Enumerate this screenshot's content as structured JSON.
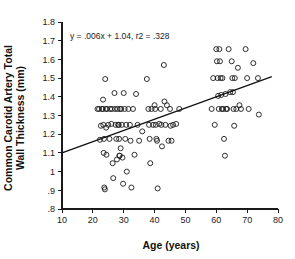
{
  "chart_data": {
    "type": "scatter",
    "title": "",
    "xlabel": "Age (years)",
    "ylabel": "Common Carotid Artery Total Wall Thickness (mm)",
    "ylabel_line1": "Common Carotid Artery Total",
    "ylabel_line2": "Wall Thickness (mm)",
    "xlim": [
      10,
      80
    ],
    "ylim": [
      0.8,
      1.8
    ],
    "xticks": [
      10,
      20,
      30,
      40,
      50,
      60,
      70,
      80
    ],
    "xtick_labels": [
      "10",
      "20",
      "30",
      "40",
      "50",
      "60",
      "70",
      "80"
    ],
    "yticks": [
      0.8,
      0.9,
      1.0,
      1.1,
      1.2,
      1.3,
      1.4,
      1.5,
      1.6,
      1.7,
      1.8
    ],
    "ytick_labels": [
      ".8",
      ".9",
      "1",
      "1.1",
      "1.2",
      "1.3",
      "1.4",
      "1.5",
      "1.6",
      "1.7",
      "1.8"
    ],
    "grid": false,
    "legend": null,
    "marker_style": "open-circle",
    "marker_color": "#1a1a1a",
    "annotation": "y = .006x + 1.04, r2 = .328",
    "fit": {
      "type": "linear",
      "slope": 0.006,
      "intercept": 1.04,
      "r_squared": 0.328,
      "x_start": 10,
      "x_end": 78,
      "y_start": 1.1,
      "y_end": 1.508
    },
    "points": [
      [
        21.5,
        1.335
      ],
      [
        22.0,
        1.335
      ],
      [
        22.3,
        1.17
      ],
      [
        22.6,
        1.245
      ],
      [
        23.0,
        1.335
      ],
      [
        23.2,
        1.335
      ],
      [
        23.3,
        1.385
      ],
      [
        23.4,
        1.25
      ],
      [
        23.5,
        1.1
      ],
      [
        23.6,
        1.175
      ],
      [
        23.7,
        0.915
      ],
      [
        23.9,
        0.905
      ],
      [
        24.0,
        1.495
      ],
      [
        24.2,
        1.335
      ],
      [
        24.3,
        1.235
      ],
      [
        24.4,
        1.09
      ],
      [
        24.6,
        1.335
      ],
      [
        25.0,
        1.25
      ],
      [
        25.4,
        1.175
      ],
      [
        25.6,
        1.335
      ],
      [
        26.0,
        1.255
      ],
      [
        26.2,
        1.335
      ],
      [
        26.4,
        1.045
      ],
      [
        26.6,
        0.965
      ],
      [
        27.0,
        1.42
      ],
      [
        27.2,
        1.335
      ],
      [
        27.4,
        1.25
      ],
      [
        27.6,
        1.175
      ],
      [
        27.8,
        1.065
      ],
      [
        28.0,
        1.335
      ],
      [
        28.2,
        1.25
      ],
      [
        28.4,
        1.25
      ],
      [
        28.5,
        1.175
      ],
      [
        28.6,
        1.085
      ],
      [
        28.7,
        1.085
      ],
      [
        28.8,
        1.335
      ],
      [
        29.0,
        1.125
      ],
      [
        29.2,
        1.335
      ],
      [
        29.4,
        1.25
      ],
      [
        29.6,
        1.075
      ],
      [
        29.8,
        0.935
      ],
      [
        30.0,
        1.42
      ],
      [
        30.3,
        1.335
      ],
      [
        30.5,
        1.175
      ],
      [
        30.8,
        1.25
      ],
      [
        31.0,
        1.0
      ],
      [
        31.5,
        1.335
      ],
      [
        32.0,
        1.25
      ],
      [
        32.2,
        1.165
      ],
      [
        32.5,
        0.915
      ],
      [
        33.0,
        1.335
      ],
      [
        33.5,
        1.09
      ],
      [
        34.0,
        1.415
      ],
      [
        34.5,
        1.25
      ],
      [
        35.0,
        1.165
      ],
      [
        36.0,
        1.215
      ],
      [
        37.5,
        1.495
      ],
      [
        38.0,
        1.335
      ],
      [
        38.2,
        1.25
      ],
      [
        38.4,
        1.175
      ],
      [
        38.6,
        1.045
      ],
      [
        39.0,
        1.335
      ],
      [
        39.5,
        1.25
      ],
      [
        40.0,
        1.355
      ],
      [
        40.2,
        1.335
      ],
      [
        40.4,
        1.25
      ],
      [
        40.6,
        1.175
      ],
      [
        40.8,
        1.165
      ],
      [
        41.0,
        0.91
      ],
      [
        41.5,
        1.255
      ],
      [
        42.0,
        1.335
      ],
      [
        42.2,
        1.25
      ],
      [
        42.4,
        1.135
      ],
      [
        43.0,
        1.57
      ],
      [
        43.2,
        1.375
      ],
      [
        43.5,
        1.25
      ],
      [
        44.0,
        1.355
      ],
      [
        44.5,
        1.165
      ],
      [
        45.0,
        1.335
      ],
      [
        45.2,
        1.245
      ],
      [
        45.5,
        1.165
      ],
      [
        46.0,
        1.25
      ],
      [
        47.0,
        1.255
      ],
      [
        48.0,
        1.335
      ],
      [
        58.5,
        1.335
      ],
      [
        59.0,
        1.5
      ],
      [
        59.5,
        1.25
      ],
      [
        60.0,
        1.655
      ],
      [
        60.2,
        1.59
      ],
      [
        60.4,
        1.5
      ],
      [
        60.6,
        1.405
      ],
      [
        60.8,
        1.335
      ],
      [
        61.0,
        1.655
      ],
      [
        61.2,
        1.59
      ],
      [
        61.4,
        1.5
      ],
      [
        61.6,
        1.41
      ],
      [
        61.8,
        1.335
      ],
      [
        62.0,
        1.5
      ],
      [
        62.2,
        1.335
      ],
      [
        62.5,
        1.175
      ],
      [
        62.8,
        1.085
      ],
      [
        63.0,
        1.415
      ],
      [
        63.2,
        1.335
      ],
      [
        63.5,
        1.335
      ],
      [
        64.0,
        1.655
      ],
      [
        64.5,
        1.425
      ],
      [
        65.0,
        1.59
      ],
      [
        65.2,
        1.5
      ],
      [
        65.4,
        1.425
      ],
      [
        65.6,
        1.335
      ],
      [
        65.8,
        1.245
      ],
      [
        66.0,
        1.5
      ],
      [
        66.5,
        1.335
      ],
      [
        67.0,
        1.555
      ],
      [
        67.5,
        1.355
      ],
      [
        68.0,
        1.335
      ],
      [
        69.5,
        1.655
      ],
      [
        70.0,
        1.5
      ],
      [
        70.5,
        1.335
      ],
      [
        72.0,
        1.58
      ],
      [
        73.5,
        1.5
      ],
      [
        73.8,
        1.305
      ]
    ]
  }
}
